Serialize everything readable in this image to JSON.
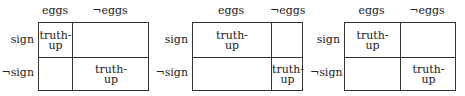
{
  "columns": [
    "eggs",
    "¬eggs"
  ],
  "rows": [
    "sign",
    "¬sign"
  ],
  "cell_label": "truth-",
  "cell_label2": "up",
  "panels": [
    {
      "cells": {
        "sign_eggs": "truth-up",
        "notsign_noteggs": "truth-up"
      }
    },
    {
      "cells": {
        "sign_eggs": "truth-up",
        "notsign_noteggs": "truth-up"
      }
    },
    {
      "cells": {
        "sign_eggs": "truth-up",
        "notsign_noteggs": "truth-up"
      }
    }
  ]
}
